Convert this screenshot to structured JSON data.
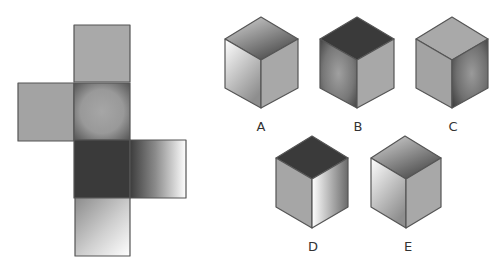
{
  "puzzle": {
    "description": "Cube net with five candidate folded cubes",
    "net": {
      "faces": [
        {
          "id": "top",
          "shade": "mid-grey"
        },
        {
          "id": "left",
          "shade": "mid-grey"
        },
        {
          "id": "center",
          "shade": "grey-vignette"
        },
        {
          "id": "dark",
          "shade": "dark"
        },
        {
          "id": "right",
          "shade": "dark-to-white-gradient"
        },
        {
          "id": "bottom",
          "shade": "grey-to-white-gradient"
        }
      ]
    },
    "options": [
      {
        "label": "A"
      },
      {
        "label": "B"
      },
      {
        "label": "C"
      },
      {
        "label": "D"
      },
      {
        "label": "E"
      }
    ]
  },
  "colors": {
    "edge": "#555555",
    "mid_grey": "#a8a8a8",
    "dark": "#3a3a3a",
    "label": "#333333"
  }
}
